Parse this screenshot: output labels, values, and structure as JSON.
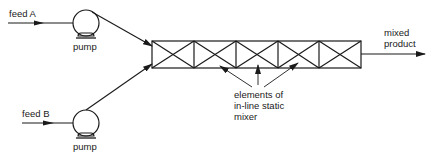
{
  "diagram": {
    "feeds": [
      {
        "id": "A",
        "label": "feed A",
        "pump_label": "pump"
      },
      {
        "id": "B",
        "label": "feed B",
        "pump_label": "pump"
      }
    ],
    "mixer": {
      "element_count": 5,
      "annotation_lines": [
        "elements of",
        "in-line static",
        "mixer"
      ]
    },
    "output": {
      "label_lines": [
        "mixed",
        "product"
      ]
    },
    "colors": {
      "stroke": "#1a1a1a",
      "background": "#ffffff"
    }
  }
}
